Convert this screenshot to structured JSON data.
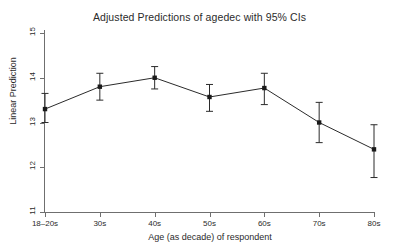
{
  "chart_data": {
    "type": "line",
    "title": "Adjusted Predictions of agedec with 95% CIs",
    "xlabel": "Age (as decade) of respondent",
    "ylabel": "Linear Prediction",
    "categories": [
      "18–20s",
      "30s",
      "40s",
      "50s",
      "60s",
      "70s",
      "80s"
    ],
    "values": [
      13.3,
      13.8,
      14.0,
      13.57,
      13.77,
      13.0,
      12.4
    ],
    "ci_lower": [
      13.0,
      13.5,
      13.75,
      13.25,
      13.4,
      12.55,
      11.77
    ],
    "ci_upper": [
      13.65,
      14.1,
      14.25,
      13.85,
      14.1,
      13.45,
      12.95
    ],
    "ylim": [
      11,
      15
    ],
    "yticks": [
      11,
      12,
      13,
      14,
      15
    ],
    "ytick_labels": [
      "11",
      "12",
      "13",
      "14",
      "15"
    ],
    "grid": false,
    "legend": "none",
    "marker": "filled-square",
    "error_bars": "95% CI",
    "line_color": "#2b2b2b",
    "marker_color": "#1a1a1a",
    "axis_color": "#6f6f6f"
  }
}
